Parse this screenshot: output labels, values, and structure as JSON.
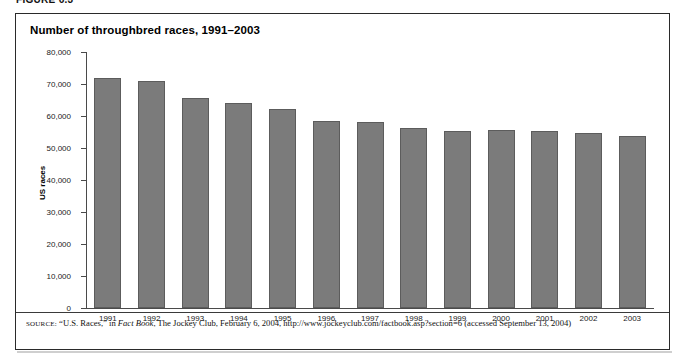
{
  "figure": {
    "header_label": "FIGURE 6.3"
  },
  "panel": {
    "title": "Number of throughbred races, 1991–2003",
    "source": {
      "label": "SOURCE:",
      "text_before_italic": " “U.S. Races,” in ",
      "italic_title": "Fact Book",
      "text_after_italic": ", The Jockey Club, February 6, 2004, http://www.jockeyclub.com/factbook.asp?section=6 (accessed September 13, 2004)"
    }
  },
  "chart_data": {
    "type": "bar",
    "title": "Number of throughbred races, 1991–2003",
    "xlabel": "",
    "ylabel": "US races",
    "categories": [
      "1991",
      "1992",
      "1993",
      "1994",
      "1995",
      "1996",
      "1997",
      "1998",
      "1999",
      "2000",
      "2001",
      "2002",
      "2003"
    ],
    "values": [
      72000,
      71000,
      65500,
      64000,
      62300,
      58500,
      58000,
      56200,
      55300,
      55500,
      55400,
      54600,
      53800
    ],
    "ylim": [
      0,
      80000
    ],
    "ytick_labels": [
      "80,000",
      "70,000",
      "60,000",
      "50,000",
      "40,000",
      "30,000",
      "20,000",
      "10,000",
      "0"
    ],
    "ytick_values": [
      80000,
      70000,
      60000,
      50000,
      40000,
      30000,
      20000,
      10000,
      0
    ],
    "grid": false,
    "legend": "none",
    "bar_color": "#7b7b7b",
    "bar_border_color": "#5c5c5c"
  }
}
